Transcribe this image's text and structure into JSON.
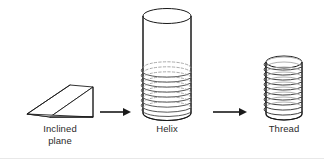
{
  "figure": {
    "background_color": "#ffffff",
    "stroke_color": "#1a1a1a",
    "fill_color": "#ffffff",
    "label_color": "#2b2b2b",
    "width": 324,
    "height": 159
  },
  "stages": [
    {
      "id": "inclined-plane",
      "label": "Inclined\nplane",
      "shape": "wedge",
      "description": "Three-dimensional wedge / ramp shown in oblique projection with a sloping top face"
    },
    {
      "id": "helix",
      "label": "Helix",
      "shape": "cylinder-with-coils",
      "coil_count": 9,
      "description": "Open cylinder with a helical coil wound around its lower half"
    },
    {
      "id": "thread",
      "label": "Thread",
      "shape": "threaded-cylinder",
      "thread_count": 10,
      "description": "Short cylinder fully covered by helical screw threads"
    }
  ],
  "connectors": [
    {
      "id": "arrow-1",
      "from": "inclined-plane",
      "to": "helix",
      "direction": "right"
    },
    {
      "id": "arrow-2",
      "from": "helix",
      "to": "thread",
      "direction": "right"
    }
  ]
}
